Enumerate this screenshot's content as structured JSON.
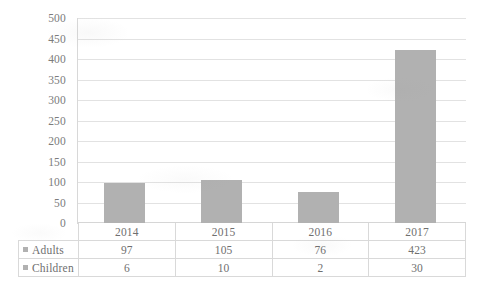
{
  "chart_data": {
    "type": "bar",
    "title": "",
    "subtitle": "",
    "xlabel": "",
    "ylabel": "",
    "categories": [
      "2014",
      "2015",
      "2016",
      "2017"
    ],
    "series": [
      {
        "name": "Adults",
        "values": [
          97,
          105,
          76,
          423
        ],
        "color": "#b1b1b1",
        "plotted": true
      },
      {
        "name": "Children",
        "values": [
          6,
          10,
          2,
          30
        ],
        "color": "#b1b1b1",
        "plotted": false
      }
    ],
    "y_ticks": [
      0,
      50,
      100,
      150,
      200,
      250,
      300,
      350,
      400,
      450,
      500
    ],
    "ylim": [
      0,
      500
    ],
    "grid": true,
    "legend_position": "data-table",
    "data_table_visible": true,
    "legend_keys_visible": true
  },
  "axis": {
    "y_tick_labels": [
      "500",
      "450",
      "400",
      "350",
      "300",
      "250",
      "200",
      "150",
      "100",
      "50",
      "0"
    ]
  },
  "table": {
    "category_labels": [
      "2014",
      "2015",
      "2016",
      "2017"
    ],
    "rows": [
      {
        "label": "Adults",
        "cells": [
          "97",
          "105",
          "76",
          "423"
        ]
      },
      {
        "label": "Children",
        "cells": [
          "6",
          "10",
          "2",
          "30"
        ]
      }
    ]
  },
  "colors": {
    "bar_fill": "#b1b1b1",
    "gridline": "#e2e2e2",
    "table_border": "#d9d9d9",
    "text": "#6f6f6f",
    "background": "#ffffff"
  }
}
